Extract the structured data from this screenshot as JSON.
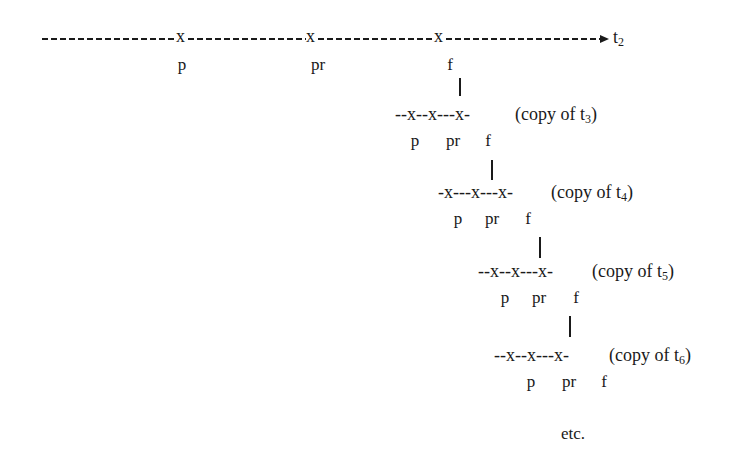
{
  "diagram": {
    "main_timeline": {
      "label": "t",
      "label_sub": "2",
      "markers": [
        {
          "symbol": "x",
          "label": "p"
        },
        {
          "symbol": "x",
          "label": "pr"
        },
        {
          "symbol": "x",
          "label": "f"
        }
      ]
    },
    "copies": [
      {
        "line": "--x--x---x-",
        "caption_prefix": "(copy of t",
        "caption_sub": "3",
        "caption_suffix": ")",
        "labels": [
          "p",
          "pr",
          "f"
        ]
      },
      {
        "line": "-x---x---x-",
        "caption_prefix": "(copy of t",
        "caption_sub": "4",
        "caption_suffix": ")",
        "labels": [
          "p",
          "pr",
          "f"
        ]
      },
      {
        "line": "--x--x---x-",
        "caption_prefix": "(copy of t",
        "caption_sub": "5",
        "caption_suffix": ")",
        "labels": [
          "p",
          "pr",
          "f"
        ]
      },
      {
        "line": "--x--x---x-",
        "caption_prefix": "(copy of t",
        "caption_sub": "6",
        "caption_suffix": ")",
        "labels": [
          "p",
          "pr",
          "f"
        ]
      }
    ],
    "connector": "|",
    "footer": "etc."
  }
}
